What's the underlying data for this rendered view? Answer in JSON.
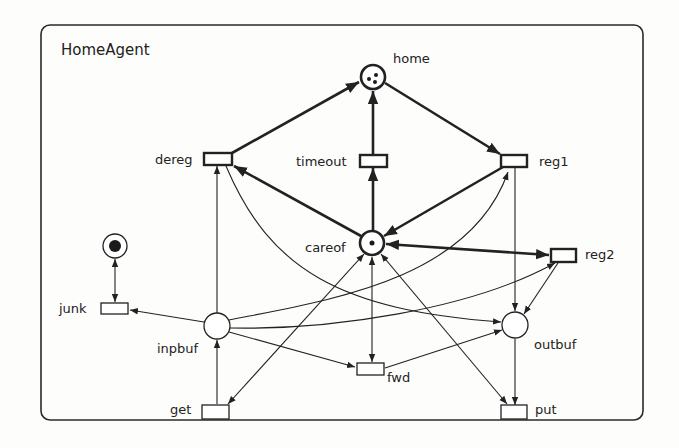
{
  "diagram": {
    "title": "HomeAgent",
    "type": "petri-net",
    "places": [
      {
        "id": "home",
        "label": "home",
        "tokens": 3
      },
      {
        "id": "careof",
        "label": "careof",
        "tokens": 1
      },
      {
        "id": "junk_place",
        "label": "",
        "tokens": 1
      },
      {
        "id": "inpbuf",
        "label": "inpbuf",
        "tokens": 0
      },
      {
        "id": "outbuf",
        "label": "outbuf",
        "tokens": 0
      }
    ],
    "transitions": [
      {
        "id": "dereg",
        "label": "dereg"
      },
      {
        "id": "timeout",
        "label": "timeout"
      },
      {
        "id": "reg1",
        "label": "reg1"
      },
      {
        "id": "reg2",
        "label": "reg2"
      },
      {
        "id": "junk",
        "label": "junk"
      },
      {
        "id": "fwd",
        "label": "fwd"
      },
      {
        "id": "get",
        "label": "get"
      },
      {
        "id": "put",
        "label": "put"
      }
    ],
    "arcs": [
      {
        "from": "dereg",
        "to": "home",
        "weight": "bold"
      },
      {
        "from": "timeout",
        "to": "home",
        "weight": "bold"
      },
      {
        "from": "home",
        "to": "reg1",
        "weight": "bold"
      },
      {
        "from": "careof",
        "to": "dereg",
        "weight": "bold"
      },
      {
        "from": "careof",
        "to": "timeout",
        "weight": "bold"
      },
      {
        "from": "reg1",
        "to": "careof",
        "weight": "bold"
      },
      {
        "from": "careof",
        "to": "reg2",
        "weight": "bold",
        "bidirectional": true
      },
      {
        "from": "junk_place",
        "to": "junk",
        "bidirectional": true
      },
      {
        "from": "inpbuf",
        "to": "junk"
      },
      {
        "from": "inpbuf",
        "to": "dereg"
      },
      {
        "from": "inpbuf",
        "to": "reg1"
      },
      {
        "from": "inpbuf",
        "to": "reg2"
      },
      {
        "from": "inpbuf",
        "to": "fwd"
      },
      {
        "from": "get",
        "to": "inpbuf"
      },
      {
        "from": "dereg",
        "to": "outbuf"
      },
      {
        "from": "reg1",
        "to": "outbuf"
      },
      {
        "from": "reg2",
        "to": "outbuf"
      },
      {
        "from": "fwd",
        "to": "outbuf"
      },
      {
        "from": "outbuf",
        "to": "put"
      },
      {
        "from": "careof",
        "to": "fwd",
        "bidirectional": true
      },
      {
        "from": "careof",
        "to": "get",
        "bidirectional": true
      },
      {
        "from": "careof",
        "to": "put",
        "bidirectional": true
      }
    ]
  }
}
